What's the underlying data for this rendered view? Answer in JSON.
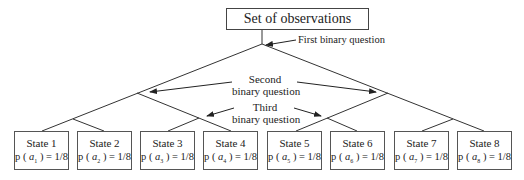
{
  "root": {
    "label": "Set of observations"
  },
  "annotations": {
    "first": "First binary question",
    "second_line1": "Second",
    "second_line2": "binary question",
    "third_line1": "Third",
    "third_line2": "binary question"
  },
  "states": [
    {
      "label": "State  1",
      "prob_prefix": "p (",
      "var": "a",
      "sub": "1",
      "prob_suffix": ") = 1/8"
    },
    {
      "label": "State  2",
      "prob_prefix": "p (",
      "var": "a",
      "sub": "2",
      "prob_suffix": ") = 1/8"
    },
    {
      "label": "State  3",
      "prob_prefix": "p (",
      "var": "a",
      "sub": "3",
      "prob_suffix": ") = 1/8"
    },
    {
      "label": "State  4",
      "prob_prefix": "p (",
      "var": "a",
      "sub": "4",
      "prob_suffix": ") = 1/8"
    },
    {
      "label": "State  5",
      "prob_prefix": "p (",
      "var": "a",
      "sub": "5",
      "prob_suffix": ") = 1/8"
    },
    {
      "label": "State  6",
      "prob_prefix": "p (",
      "var": "a",
      "sub": "6",
      "prob_suffix": ") = 1/8"
    },
    {
      "label": "State  7",
      "prob_prefix": "p (",
      "var": "a",
      "sub": "7",
      "prob_suffix": ") = 1/8"
    },
    {
      "label": "State  8",
      "prob_prefix": "p (",
      "var": "a",
      "sub": "8",
      "prob_suffix": ") = 1/8"
    }
  ]
}
